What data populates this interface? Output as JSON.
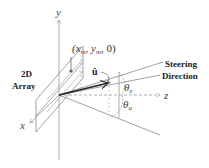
{
  "diagram": {
    "axes": {
      "x": "x",
      "y": "y",
      "z": "z"
    },
    "array_label": {
      "line1": "2D",
      "line2": "Array"
    },
    "element_coord": {
      "text": "(x",
      "sub1": "m",
      "mid": ", y",
      "sub2": "m",
      "end": ", 0)"
    },
    "unit_vector": "û",
    "theta_e": {
      "symbol": "θ",
      "sub": "e"
    },
    "theta_a": {
      "symbol": "θ",
      "sub": "a"
    },
    "steering_label": {
      "line1": "Steering",
      "line2": "Direction"
    },
    "colors": {
      "line": "#888888",
      "axis": "#999999",
      "text": "#333333",
      "vector": "#222222"
    }
  }
}
